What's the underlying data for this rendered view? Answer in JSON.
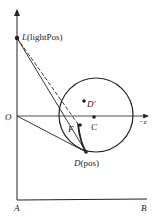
{
  "diagram": {
    "labels": {
      "L": "L",
      "L_suffix": "(lightPos)",
      "O": "O",
      "F": "F",
      "C": "C",
      "D_prime": "D′",
      "D": "D",
      "D_suffix": "(pos)",
      "neg_z": "−z",
      "A": "A",
      "B": "B"
    },
    "colors": {
      "stroke": "#222222",
      "background": "#ffffff"
    }
  }
}
